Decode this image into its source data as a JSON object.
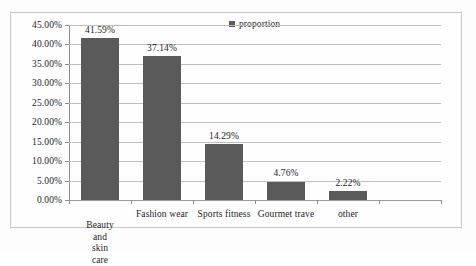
{
  "chart_data": {
    "type": "bar",
    "title": "",
    "subtitle": "",
    "xlabel": "",
    "ylabel": "",
    "categories": [
      "Beauty and\nskin care",
      "Fashion wear",
      "Sports fitness",
      "Gourmet trave",
      "other",
      ""
    ],
    "values": [
      41.59,
      37.14,
      14.29,
      4.76,
      2.22,
      null
    ],
    "value_labels": [
      "41.59%",
      "37.14%",
      "14.29%",
      "4.76%",
      "2.22%",
      ""
    ],
    "series": [
      {
        "name": "proportion",
        "values": [
          41.59,
          37.14,
          14.29,
          4.76,
          2.22,
          null
        ]
      }
    ],
    "ylim": [
      0,
      45
    ],
    "ytick_values": [
      0,
      5,
      10,
      15,
      20,
      25,
      30,
      35,
      40,
      45
    ],
    "ytick_labels": [
      "0.00%",
      "5.00%",
      "10.00%",
      "15.00%",
      "20.00%",
      "25.00%",
      "30.00%",
      "35.00%",
      "40.00%",
      "45.00%"
    ],
    "grid": true,
    "legend": {
      "position": "top-center",
      "entries": [
        {
          "label": "proportion",
          "color": "#5a5a5a"
        }
      ]
    },
    "colors": {
      "bar": "#5a5a5a",
      "gridline": "#bfbfbf",
      "axis": "#8f8f8f",
      "text": "#1d1d1d",
      "frame": "#c8c8c8",
      "background": "#fefefe"
    }
  }
}
